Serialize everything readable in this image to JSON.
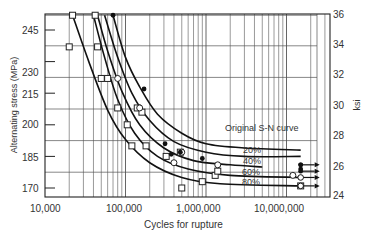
{
  "chart_data": {
    "type": "line",
    "title": "",
    "xlabel": "Cycles for rupture",
    "ylabel": "Alternating stress (MPa)",
    "ylabel_right": "ksi",
    "xscale": "log",
    "xlim": [
      10000,
      30000000
    ],
    "ylim": [
      165,
      252
    ],
    "ylim_right": [
      24,
      36
    ],
    "grid": true,
    "x_tick_labels": [
      "10,000",
      "100,000",
      "1,000,000",
      "10,000,000"
    ],
    "x_ticks": [
      10000,
      100000,
      1000000,
      10000000
    ],
    "y_tick_labels": [
      "245",
      "230",
      "215",
      "200",
      "185",
      "170"
    ],
    "y_ticks": [
      245,
      230,
      215,
      200,
      185,
      170
    ],
    "y_right_tick_labels": [
      "36",
      "34",
      "32",
      "30",
      "28",
      "26",
      "24"
    ],
    "y_right_ticks": [
      36,
      34,
      32,
      30,
      28,
      26,
      24
    ],
    "series": [
      {
        "name": "Original S-N curve",
        "label": "Original S-N curve",
        "points": [
          [
            70000,
            252
          ],
          [
            100000,
            232
          ],
          [
            150000,
            218
          ],
          [
            250000,
            205
          ],
          [
            500000,
            196
          ],
          [
            1000000,
            191
          ],
          [
            3000000,
            189
          ],
          [
            15000000,
            188
          ]
        ]
      },
      {
        "name": "20%",
        "label": "20%",
        "points": [
          [
            55000,
            252
          ],
          [
            80000,
            232
          ],
          [
            120000,
            215
          ],
          [
            200000,
            202
          ],
          [
            400000,
            192
          ],
          [
            1000000,
            187
          ],
          [
            3000000,
            185
          ],
          [
            15000000,
            185
          ]
        ]
      },
      {
        "name": "40%",
        "label": "40%",
        "points": [
          [
            45000,
            252
          ],
          [
            60000,
            235
          ],
          [
            90000,
            216
          ],
          [
            150000,
            200
          ],
          [
            300000,
            189
          ],
          [
            700000,
            183
          ],
          [
            2000000,
            181
          ],
          [
            5000000,
            180
          ]
        ]
      },
      {
        "name": "60%",
        "label": "60%",
        "points": [
          [
            40000,
            252
          ],
          [
            55000,
            232
          ],
          [
            80000,
            212
          ],
          [
            130000,
            196
          ],
          [
            250000,
            185
          ],
          [
            600000,
            179
          ],
          [
            2000000,
            176
          ],
          [
            15000000,
            175
          ]
        ]
      },
      {
        "name": "80%",
        "label": "80%",
        "points": [
          [
            22000,
            252
          ],
          [
            35000,
            230
          ],
          [
            60000,
            207
          ],
          [
            100000,
            193
          ],
          [
            200000,
            182
          ],
          [
            500000,
            175
          ],
          [
            1500000,
            172
          ],
          [
            15000000,
            171
          ]
        ]
      }
    ],
    "markers": {
      "open_squares": [
        [
          22000,
          252
        ],
        [
          20000,
          237
        ],
        [
          42000,
          252
        ],
        [
          45000,
          237
        ],
        [
          50000,
          222
        ],
        [
          60000,
          222
        ],
        [
          80000,
          208
        ],
        [
          105000,
          200
        ],
        [
          140000,
          208
        ],
        [
          160000,
          206
        ],
        [
          120000,
          190
        ],
        [
          180000,
          190
        ],
        [
          320000,
          185
        ],
        [
          480000,
          187
        ],
        [
          900000,
          173
        ],
        [
          1300000,
          176
        ],
        [
          1400000,
          178
        ],
        [
          15000000,
          171
        ],
        [
          500000,
          170
        ]
      ],
      "open_circles": [
        [
          80000,
          222
        ],
        [
          150000,
          208
        ],
        [
          400000,
          182
        ],
        [
          500000,
          187
        ],
        [
          12000000,
          176
        ],
        [
          1400000,
          181
        ]
      ],
      "filled_dots": [
        [
          70000,
          252
        ],
        [
          170000,
          217
        ],
        [
          310000,
          191
        ],
        [
          370000,
          186
        ],
        [
          480000,
          187
        ],
        [
          900000,
          184
        ],
        [
          15000000,
          179
        ],
        [
          15000000,
          181
        ]
      ],
      "runouts": [
        {
          "cycles": 15000000,
          "stress": 181,
          "marker": "filled"
        },
        {
          "cycles": 15000000,
          "stress": 178,
          "marker": "filled"
        },
        {
          "cycles": 15000000,
          "stress": 175,
          "marker": "open"
        },
        {
          "cycles": 15000000,
          "stress": 171,
          "marker": "open"
        }
      ]
    },
    "annotations": [
      "Original S-N curve",
      "20%",
      "40%",
      "60%",
      "80%"
    ]
  },
  "labels": {
    "ylabel": "Alternating stress (MPa)",
    "ylabel_right": "ksi",
    "xlabel": "Cycles for rupture",
    "curve_original": "Original S-N curve",
    "curve_20": "20%",
    "curve_40": "40%",
    "curve_60": "60%",
    "curve_80": "80%",
    "x_ticks": [
      "10,000",
      "100,000",
      "1,000,000",
      "10,000,000"
    ],
    "y_ticks": [
      "245",
      "230",
      "215",
      "200",
      "185",
      "170"
    ],
    "y_right_ticks": [
      "36",
      "34",
      "32",
      "30",
      "28",
      "26",
      "24"
    ]
  }
}
